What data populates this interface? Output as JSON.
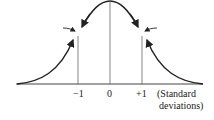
{
  "diagram": {
    "ticks": [
      {
        "label": "−1",
        "x": 78
      },
      {
        "label": "0",
        "x": 110
      },
      {
        "label": "+1",
        "x": 142
      }
    ],
    "axis_unit_line1": "(Standard",
    "axis_unit_line2": "deviations)",
    "annotations": [
      {
        "type": "inflection-point-arrows",
        "side": "left",
        "x": 78
      },
      {
        "type": "inflection-point-arrows",
        "side": "right",
        "x": 142
      }
    ],
    "colors": {
      "stroke": "#222222",
      "line": "#555555",
      "text": "#222222"
    }
  }
}
